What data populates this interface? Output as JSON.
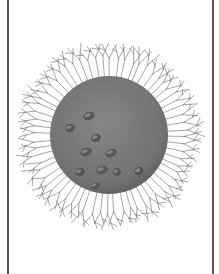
{
  "image": {
    "subject": "spherical cell with radiating branched filaments",
    "colors": {
      "background": "#ffffff",
      "frame": "#555555",
      "cell_body": "#7d7d7d",
      "cell_dark": "#5e5e5e",
      "filament": "#6a6a6a",
      "granule": "#575757"
    },
    "cell": {
      "cx": 109,
      "cy": 135,
      "r": 59
    },
    "filaments": {
      "count": 64,
      "inner_r": 58,
      "outer_r": 92
    },
    "granules": [
      {
        "x": 89,
        "y": 116,
        "rx": 6,
        "ry": 4
      },
      {
        "x": 70,
        "y": 128,
        "rx": 5,
        "ry": 4
      },
      {
        "x": 96,
        "y": 138,
        "rx": 5,
        "ry": 4
      },
      {
        "x": 86,
        "y": 152,
        "rx": 6,
        "ry": 4
      },
      {
        "x": 111,
        "y": 153,
        "rx": 6,
        "ry": 4
      },
      {
        "x": 80,
        "y": 172,
        "rx": 5,
        "ry": 4
      },
      {
        "x": 102,
        "y": 170,
        "rx": 6,
        "ry": 4
      },
      {
        "x": 117,
        "y": 172,
        "rx": 4,
        "ry": 4
      },
      {
        "x": 139,
        "y": 171,
        "rx": 5,
        "ry": 4
      },
      {
        "x": 95,
        "y": 186,
        "rx": 5,
        "ry": 3
      }
    ]
  }
}
